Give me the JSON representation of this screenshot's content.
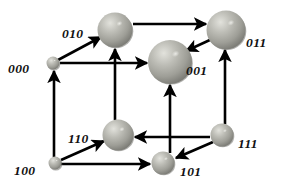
{
  "figure": {
    "background_color": "#ffffff",
    "edge_color": "#000000",
    "label_color": "#111111",
    "node_fill": "#a8a8a0",
    "node_highlight": "#d8d8d2",
    "node_shadow": "#6f6f6a"
  },
  "nodes": [
    {
      "id": "000",
      "label": "000",
      "cx": 53,
      "cy": 63,
      "r": 6.5,
      "label_x": 8,
      "label_y": 62
    },
    {
      "id": "010",
      "label": "010",
      "cx": 115,
      "cy": 30,
      "r": 17.5,
      "label_x": 62,
      "label_y": 27
    },
    {
      "id": "011",
      "label": "011",
      "cx": 226,
      "cy": 30,
      "r": 19.5,
      "label_x": 246,
      "label_y": 36
    },
    {
      "id": "001",
      "label": "001",
      "cx": 170,
      "cy": 62,
      "r": 22.0,
      "label_x": 186,
      "label_y": 64
    },
    {
      "id": "100",
      "label": "100",
      "cx": 55,
      "cy": 163,
      "r": 6.5,
      "label_x": 14,
      "label_y": 164
    },
    {
      "id": "110",
      "label": "110",
      "cx": 118,
      "cy": 135,
      "r": 15.5,
      "label_x": 68,
      "label_y": 132
    },
    {
      "id": "101",
      "label": "101",
      "cx": 163,
      "cy": 163,
      "r": 11.5,
      "label_x": 180,
      "label_y": 165
    },
    {
      "id": "111",
      "label": "111",
      "cx": 222,
      "cy": 135,
      "r": 11.5,
      "label_x": 238,
      "label_y": 137
    }
  ],
  "edges": [
    {
      "name": "edge-000-to-010",
      "from": "000",
      "to": "010",
      "x1": 58,
      "y1": 60,
      "x2": 101,
      "y2": 37,
      "arrow": "end"
    },
    {
      "name": "edge-000-to-001",
      "from": "000",
      "to": "001",
      "x1": 60,
      "y1": 63,
      "x2": 147,
      "y2": 63,
      "arrow": "end"
    },
    {
      "name": "edge-010-to-011",
      "from": "010",
      "to": "011",
      "x1": 133,
      "y1": 24,
      "x2": 206,
      "y2": 24,
      "arrow": "end"
    },
    {
      "name": "edge-011-to-001",
      "from": "011",
      "to": "001",
      "x1": 212,
      "y1": 39,
      "x2": 186,
      "y2": 51,
      "arrow": "end"
    },
    {
      "name": "edge-110-to-010",
      "from": "110",
      "to": "010",
      "x1": 115,
      "y1": 120,
      "x2": 115,
      "y2": 49,
      "arrow": "end"
    },
    {
      "name": "edge-100-to-000",
      "from": "100",
      "to": "000",
      "x1": 54,
      "y1": 157,
      "x2": 54,
      "y2": 71,
      "arrow": "end"
    },
    {
      "name": "edge-100-to-110",
      "from": "100",
      "to": "110",
      "x1": 61,
      "y1": 160,
      "x2": 104,
      "y2": 141,
      "arrow": "end"
    },
    {
      "name": "edge-100-to-101",
      "from": "100",
      "to": "101",
      "x1": 61,
      "y1": 164,
      "x2": 150,
      "y2": 164,
      "arrow": "end"
    },
    {
      "name": "edge-101-to-001",
      "from": "101",
      "to": "001",
      "x1": 170,
      "y1": 153,
      "x2": 170,
      "y2": 85,
      "arrow": "end"
    },
    {
      "name": "edge-111-to-110",
      "from": "111",
      "to": "110",
      "x1": 210,
      "y1": 137,
      "x2": 135,
      "y2": 137,
      "arrow": "end"
    },
    {
      "name": "edge-111-to-101",
      "from": "111",
      "to": "101",
      "x1": 213,
      "y1": 142,
      "x2": 176,
      "y2": 158,
      "arrow": "end"
    },
    {
      "name": "edge-111-to-011",
      "from": "111",
      "to": "011",
      "x1": 225,
      "y1": 124,
      "x2": 225,
      "y2": 50,
      "arrow": "end"
    }
  ]
}
